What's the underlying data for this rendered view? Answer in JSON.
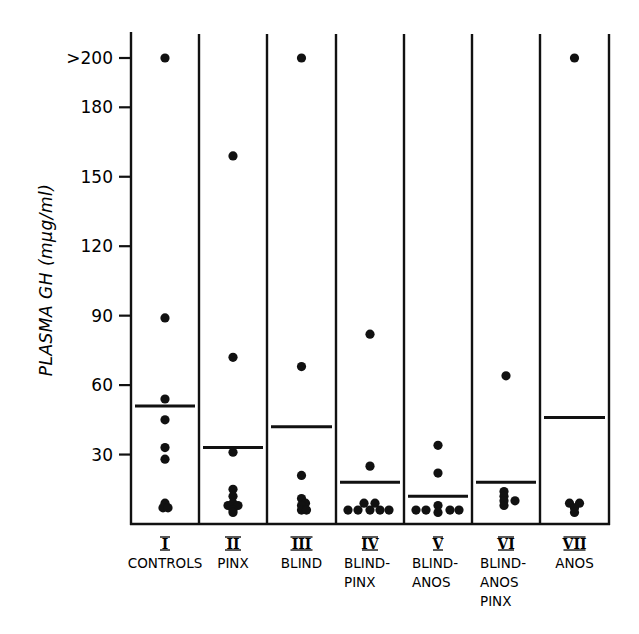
{
  "chart_data": {
    "type": "scatter",
    "subtype": "dot-strip-plot-with-mean-bars",
    "title": "",
    "ylabel": "PLASMA GH (mμg/ml)",
    "xlabel": "",
    "ylim": [
      0,
      200
    ],
    "yticks": [
      {
        "value": 30,
        "label": "30"
      },
      {
        "value": 60,
        "label": "60"
      },
      {
        "value": 90,
        "label": "90"
      },
      {
        "value": 120,
        "label": "120"
      },
      {
        "value": 150,
        "label": "150"
      },
      {
        "value": 180,
        "label": "180"
      },
      {
        "value": 201,
        "label": ">200"
      }
    ],
    "grid": false,
    "legend": null,
    "categories": [
      {
        "numeral": "I",
        "label_lines": [
          "CONTROLS"
        ]
      },
      {
        "numeral": "II",
        "label_lines": [
          "PINX"
        ]
      },
      {
        "numeral": "III",
        "label_lines": [
          "BLIND"
        ]
      },
      {
        "numeral": "IV",
        "label_lines": [
          "BLIND-",
          "PINX"
        ]
      },
      {
        "numeral": "V",
        "label_lines": [
          "BLIND-",
          "ANOS"
        ]
      },
      {
        "numeral": "VI",
        "label_lines": [
          "BLIND-",
          "ANOS",
          "PINX"
        ]
      },
      {
        "numeral": "VII",
        "label_lines": [
          "ANOS"
        ]
      }
    ],
    "series": [
      {
        "name": "I CONTROLS",
        "mean": 51,
        "points": [
          {
            "v": 201,
            "dx": 0
          },
          {
            "v": 89,
            "dx": 0
          },
          {
            "v": 54,
            "dx": 0
          },
          {
            "v": 45,
            "dx": 0
          },
          {
            "v": 33,
            "dx": 0
          },
          {
            "v": 28,
            "dx": 0
          },
          {
            "v": 9,
            "dx": 0
          },
          {
            "v": 7,
            "dx": -2
          },
          {
            "v": 7,
            "dx": 3
          }
        ]
      },
      {
        "name": "II PINX",
        "mean": 33,
        "points": [
          {
            "v": 159,
            "dx": 0
          },
          {
            "v": 72,
            "dx": 0
          },
          {
            "v": 31,
            "dx": 0
          },
          {
            "v": 15,
            "dx": 0
          },
          {
            "v": 12,
            "dx": 0
          },
          {
            "v": 9,
            "dx": 0
          },
          {
            "v": 8,
            "dx": -5
          },
          {
            "v": 8,
            "dx": 5
          },
          {
            "v": 6,
            "dx": 0
          },
          {
            "v": 5,
            "dx": 0
          }
        ]
      },
      {
        "name": "III BLIND",
        "mean": 42,
        "points": [
          {
            "v": 201,
            "dx": 0
          },
          {
            "v": 68,
            "dx": 0
          },
          {
            "v": 21,
            "dx": 0
          },
          {
            "v": 11,
            "dx": 0
          },
          {
            "v": 9,
            "dx": 4
          },
          {
            "v": 8,
            "dx": 0
          },
          {
            "v": 6,
            "dx": 0
          },
          {
            "v": 6,
            "dx": 5
          }
        ]
      },
      {
        "name": "IV BLIND-PINX",
        "mean": 18,
        "points": [
          {
            "v": 82,
            "dx": 0
          },
          {
            "v": 25,
            "dx": 0
          },
          {
            "v": 9,
            "dx": -6
          },
          {
            "v": 9,
            "dx": 5
          },
          {
            "v": 6,
            "dx": -22
          },
          {
            "v": 6,
            "dx": -12
          },
          {
            "v": 6,
            "dx": 0
          },
          {
            "v": 6,
            "dx": 10
          },
          {
            "v": 6,
            "dx": 19
          }
        ]
      },
      {
        "name": "V BLIND-ANOS",
        "mean": 12,
        "points": [
          {
            "v": 34,
            "dx": 0
          },
          {
            "v": 22,
            "dx": 0
          },
          {
            "v": 6,
            "dx": -22
          },
          {
            "v": 6,
            "dx": -12
          },
          {
            "v": 8,
            "dx": 0
          },
          {
            "v": 5,
            "dx": 0
          },
          {
            "v": 6,
            "dx": 12
          },
          {
            "v": 6,
            "dx": 21
          }
        ]
      },
      {
        "name": "VI BLIND-ANOS-PINX",
        "mean": 18,
        "points": [
          {
            "v": 64,
            "dx": 0
          },
          {
            "v": 14,
            "dx": -2
          },
          {
            "v": 12,
            "dx": -2
          },
          {
            "v": 10,
            "dx": -2
          },
          {
            "v": 10,
            "dx": 9
          },
          {
            "v": 8,
            "dx": -2
          }
        ]
      },
      {
        "name": "VII ANOS",
        "mean": 46,
        "points": [
          {
            "v": 201,
            "dx": 0
          },
          {
            "v": 9,
            "dx": -5
          },
          {
            "v": 9,
            "dx": 5
          },
          {
            "v": 7,
            "dx": 0
          },
          {
            "v": 5,
            "dx": 0
          }
        ]
      }
    ]
  }
}
